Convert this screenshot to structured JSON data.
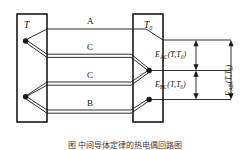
{
  "figure": {
    "type": "thermocouple-circuit-diagram",
    "caption": "图     中间导体定律的热电偶回路图",
    "colors": {
      "line": "#1a1a1a",
      "background": "#ffffff",
      "text": "#111111",
      "caption_text": "#3b3b3b"
    },
    "blocks": [
      {
        "id": "hot-junction-block",
        "label": "T"
      },
      {
        "id": "cold-junction-block",
        "label": "T₀"
      }
    ],
    "conductors": [
      {
        "id": "conductor-a",
        "label": "A"
      },
      {
        "id": "conductor-c-upper",
        "label": "C"
      },
      {
        "id": "conductor-c-lower",
        "label": "C"
      },
      {
        "id": "conductor-b",
        "label": "B"
      }
    ],
    "emf_labels": [
      {
        "id": "emf-ac",
        "base": "E",
        "sub": "AC",
        "args": "(T,T₀)"
      },
      {
        "id": "emf-bc",
        "base": "E",
        "sub": "BC",
        "args": "(T,T₀)"
      },
      {
        "id": "emf-ab",
        "base": "E",
        "sub": "AB",
        "args": "(T,T₀)"
      }
    ],
    "junction_dots": [
      {
        "id": "junction-dot-hot-upper"
      },
      {
        "id": "junction-dot-hot-lower"
      },
      {
        "id": "junction-dot-cold-upper"
      },
      {
        "id": "junction-dot-cold-lower"
      }
    ]
  }
}
